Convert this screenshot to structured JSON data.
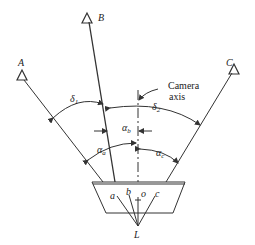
{
  "diagram": {
    "type": "camera resection geometry",
    "stations": [
      {
        "id": "A",
        "label": "A"
      },
      {
        "id": "B",
        "label": "B"
      },
      {
        "id": "C",
        "label": "C"
      }
    ],
    "image_points": [
      {
        "id": "a",
        "label": "a"
      },
      {
        "id": "b",
        "label": "b"
      },
      {
        "id": "o",
        "label": "o"
      },
      {
        "id": "c",
        "label": "c"
      }
    ],
    "perspective_center": {
      "label": "L"
    },
    "camera_axis_label_line1": "Camera",
    "camera_axis_label_line2": "axis",
    "angles": {
      "delta1": {
        "symbol": "δ",
        "sub": "1"
      },
      "delta2": {
        "symbol": "δ",
        "sub": "2"
      },
      "alpha_a": {
        "symbol": "α",
        "sub": "a"
      },
      "alpha_b": {
        "symbol": "α",
        "sub": "b"
      },
      "alpha_c": {
        "symbol": "α",
        "sub": "c"
      }
    },
    "line_color": "#333333"
  }
}
